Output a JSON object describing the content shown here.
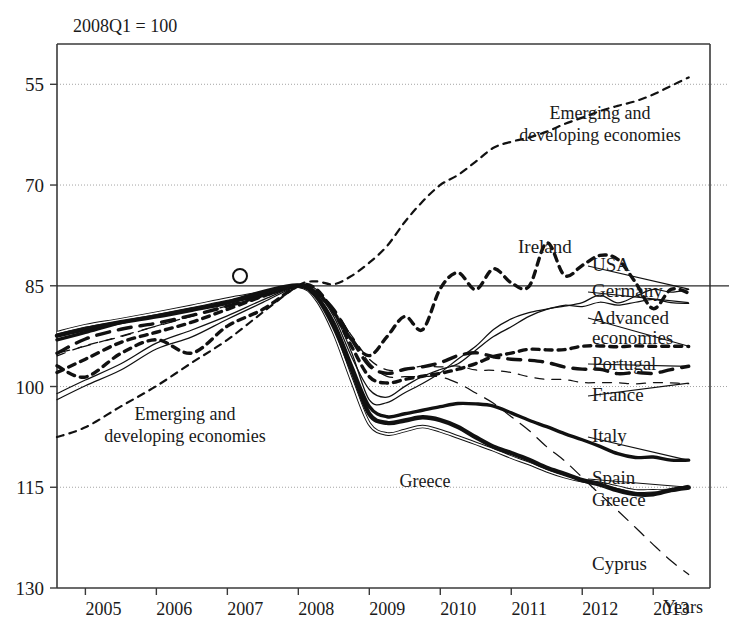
{
  "figure": {
    "note": "2008Q1 = 100",
    "xaxis_title": "Years",
    "yaxis_title": ""
  },
  "chart_data": {
    "type": "line",
    "title": "2008Q1 = 100",
    "subtitle": "",
    "xlabel": "Years",
    "ylabel": "",
    "xlim": [
      2004.6,
      2013.8
    ],
    "ylim": [
      55,
      136
    ],
    "yticks": [
      55,
      70,
      85,
      100,
      115,
      130
    ],
    "xticks": [
      2005,
      2006,
      2007,
      2008,
      2009,
      2010,
      2011,
      2012,
      2013
    ],
    "grid": true,
    "reference_line": 100,
    "legend_position": "right-inline-labels",
    "annotations": [
      {
        "text": "Emerging and developing economies",
        "x": 2006.2,
        "y": 80
      },
      {
        "text": "Emerging and developing economies",
        "x": 2012.0,
        "y": 124
      },
      {
        "text": "Greece",
        "x": 2010.9,
        "y": 72
      }
    ],
    "series": [
      {
        "name": "Emerging and developing economies",
        "style": "short-dashed thick",
        "x": [
          2004.6,
          2005.0,
          2005.5,
          2006.0,
          2006.5,
          2007.0,
          2007.5,
          2008.0,
          2008.25,
          2008.5,
          2008.75,
          2009.0,
          2009.25,
          2009.5,
          2009.75,
          2010.0,
          2010.25,
          2010.5,
          2010.75,
          2011.0,
          2011.25,
          2011.5,
          2011.75,
          2012.0,
          2012.25,
          2012.5,
          2012.75,
          2013.0,
          2013.25,
          2013.5
        ],
        "y": [
          77.5,
          79.0,
          82.0,
          85.0,
          88.5,
          92.0,
          96.0,
          100.0,
          100.7,
          100.2,
          101.5,
          103.5,
          106.0,
          109.5,
          112.5,
          115.0,
          116.5,
          118.5,
          120.5,
          121.5,
          122.0,
          123.0,
          124.0,
          125.0,
          126.0,
          126.8,
          127.5,
          128.5,
          129.8,
          131.0
        ]
      },
      {
        "name": "Ireland",
        "style": "short-dashed thick",
        "x": [
          2004.6,
          2005.0,
          2005.5,
          2006.0,
          2006.5,
          2007.0,
          2007.5,
          2008.0,
          2008.25,
          2008.5,
          2008.75,
          2009.0,
          2009.25,
          2009.5,
          2009.75,
          2010.0,
          2010.25,
          2010.5,
          2010.75,
          2011.0,
          2011.25,
          2011.5,
          2011.75,
          2012.0,
          2012.25,
          2012.5,
          2012.75,
          2013.0,
          2013.25,
          2013.5
        ],
        "y": [
          88.0,
          86.5,
          90.0,
          92.0,
          90.0,
          94.0,
          96.5,
          100.0,
          99.5,
          96.0,
          92.0,
          89.5,
          92.5,
          95.5,
          93.5,
          99.5,
          102.0,
          99.5,
          102.5,
          100.5,
          100.0,
          106.5,
          101.5,
          103.0,
          104.5,
          104.0,
          100.5,
          96.5,
          99.5,
          99.0
        ]
      },
      {
        "name": "USA",
        "style": "thin",
        "x": [
          2004.6,
          2005.0,
          2005.5,
          2006.0,
          2006.5,
          2007.0,
          2007.5,
          2008.0,
          2008.25,
          2008.5,
          2008.75,
          2009.0,
          2009.25,
          2009.5,
          2009.75,
          2010.0,
          2010.25,
          2010.5,
          2010.75,
          2011.0,
          2011.25,
          2011.5,
          2011.75,
          2012.0,
          2012.25,
          2012.5,
          2012.75,
          2013.0,
          2013.25,
          2013.5
        ],
        "y": [
          84.0,
          86.0,
          88.5,
          91.5,
          93.5,
          95.5,
          98.0,
          100.0,
          99.0,
          95.5,
          89.5,
          84.5,
          83.5,
          85.0,
          86.5,
          87.5,
          88.5,
          90.5,
          92.5,
          94.0,
          95.5,
          96.5,
          97.0,
          97.5,
          98.5,
          97.5,
          98.5,
          99.5,
          99.0,
          99.5
        ]
      },
      {
        "name": "Germany",
        "style": "thin",
        "x": [
          2004.6,
          2005.0,
          2005.5,
          2006.0,
          2006.5,
          2007.0,
          2007.5,
          2008.0,
          2008.25,
          2008.5,
          2008.75,
          2009.0,
          2009.25,
          2009.5,
          2009.75,
          2010.0,
          2010.25,
          2010.5,
          2010.75,
          2011.0,
          2011.25,
          2011.5,
          2011.75,
          2012.0,
          2012.25,
          2012.5,
          2012.75,
          2013.0,
          2013.25,
          2013.5
        ],
        "y": [
          83.0,
          85.0,
          87.5,
          90.5,
          92.5,
          95.0,
          97.5,
          100.0,
          99.5,
          96.0,
          90.0,
          83.0,
          82.5,
          84.0,
          85.5,
          87.0,
          89.0,
          91.0,
          93.5,
          95.0,
          96.0,
          96.5,
          97.0,
          97.0,
          97.5,
          97.0,
          97.5,
          98.0,
          97.5,
          97.5
        ]
      },
      {
        "name": "Advanced economies",
        "style": "short-dashed thick",
        "x": [
          2004.6,
          2005.0,
          2005.5,
          2006.0,
          2006.5,
          2007.0,
          2007.5,
          2008.0,
          2008.25,
          2008.5,
          2008.75,
          2009.0,
          2009.25,
          2009.5,
          2009.75,
          2010.0,
          2010.25,
          2010.5,
          2010.75,
          2011.0,
          2011.25,
          2011.5,
          2011.75,
          2012.0,
          2012.25,
          2012.5,
          2012.75,
          2013.0,
          2013.25,
          2013.5
        ],
        "y": [
          87.0,
          89.0,
          91.5,
          93.0,
          94.5,
          96.5,
          98.5,
          100.0,
          99.0,
          96.0,
          91.0,
          86.5,
          85.5,
          86.0,
          86.5,
          87.0,
          87.5,
          88.5,
          89.5,
          90.0,
          90.5,
          90.5,
          90.5,
          91.0,
          91.0,
          91.0,
          91.0,
          91.0,
          91.0,
          91.0
        ]
      },
      {
        "name": "Portugal",
        "style": "long-dashed thick",
        "x": [
          2004.6,
          2005.0,
          2005.5,
          2006.0,
          2006.5,
          2007.0,
          2007.5,
          2008.0,
          2008.25,
          2008.5,
          2008.75,
          2009.0,
          2009.25,
          2009.5,
          2009.75,
          2010.0,
          2010.25,
          2010.5,
          2010.75,
          2011.0,
          2011.25,
          2011.5,
          2011.75,
          2012.0,
          2012.25,
          2012.5,
          2012.75,
          2013.0,
          2013.25,
          2013.5
        ],
        "y": [
          90.0,
          92.0,
          93.5,
          94.5,
          95.5,
          97.0,
          98.5,
          100.0,
          99.0,
          96.5,
          92.0,
          88.0,
          87.0,
          87.5,
          88.0,
          88.5,
          89.5,
          90.0,
          89.5,
          89.0,
          89.0,
          88.5,
          88.0,
          87.5,
          87.5,
          87.0,
          87.0,
          87.0,
          87.5,
          88.0
        ]
      },
      {
        "name": "France",
        "style": "thin-gray",
        "x": [
          2004.6,
          2005.0,
          2005.5,
          2006.0,
          2006.5,
          2007.0,
          2007.5,
          2008.0,
          2008.25,
          2008.5,
          2008.75,
          2009.0,
          2009.25,
          2009.5,
          2009.75,
          2010.0,
          2010.25,
          2010.5,
          2010.75,
          2011.0,
          2011.25,
          2011.5,
          2011.75,
          2012.0,
          2012.25,
          2012.5,
          2012.75,
          2013.0,
          2013.25,
          2013.5
        ],
        "y": [
          89.5,
          91.0,
          92.5,
          94.0,
          95.5,
          97.0,
          98.5,
          100.0,
          99.0,
          96.5,
          92.5,
          89.0,
          87.5,
          87.5,
          88.0,
          88.0,
          88.0,
          87.5,
          87.5,
          87.0,
          86.5,
          86.0,
          86.0,
          85.5,
          85.5,
          85.5,
          85.5,
          85.5,
          85.5,
          85.5
        ]
      },
      {
        "name": "Italy",
        "style": "thick",
        "x": [
          2004.6,
          2005.0,
          2005.5,
          2006.0,
          2006.5,
          2007.0,
          2007.5,
          2008.0,
          2008.25,
          2008.5,
          2008.75,
          2009.0,
          2009.25,
          2009.5,
          2009.75,
          2010.0,
          2010.25,
          2010.5,
          2010.75,
          2011.0,
          2011.25,
          2011.5,
          2011.75,
          2012.0,
          2012.25,
          2012.5,
          2012.75,
          2013.0,
          2013.25,
          2013.5
        ],
        "y": [
          92.0,
          93.0,
          94.5,
          95.5,
          96.5,
          97.5,
          98.5,
          100.0,
          98.5,
          94.5,
          88.0,
          82.0,
          80.5,
          81.0,
          81.5,
          82.0,
          82.5,
          82.5,
          82.0,
          81.0,
          80.0,
          79.0,
          78.0,
          77.0,
          76.0,
          75.0,
          74.5,
          74.5,
          74.0,
          74.0
        ]
      },
      {
        "name": "Spain",
        "style": "double-line",
        "x": [
          2004.6,
          2005.0,
          2005.5,
          2006.0,
          2006.5,
          2007.0,
          2007.5,
          2008.0,
          2008.25,
          2008.5,
          2008.75,
          2009.0,
          2009.25,
          2009.5,
          2009.75,
          2010.0,
          2010.25,
          2010.5,
          2010.75,
          2011.0,
          2011.25,
          2011.5,
          2011.75,
          2012.0,
          2012.25,
          2012.5,
          2012.75,
          2013.0,
          2013.25,
          2013.5
        ],
        "y": [
          93.0,
          94.0,
          95.0,
          96.0,
          97.0,
          98.0,
          99.0,
          100.0,
          98.0,
          93.0,
          86.0,
          79.5,
          78.0,
          78.5,
          79.0,
          78.5,
          77.5,
          76.5,
          75.5,
          74.5,
          73.5,
          72.5,
          71.5,
          71.0,
          70.5,
          70.0,
          69.5,
          69.5,
          69.5,
          70.0
        ]
      },
      {
        "name": "Greece",
        "style": "xthick",
        "x": [
          2004.6,
          2005.0,
          2005.5,
          2006.0,
          2006.5,
          2007.0,
          2007.5,
          2008.0,
          2008.25,
          2008.5,
          2008.75,
          2009.0,
          2009.25,
          2009.5,
          2009.75,
          2010.0,
          2010.25,
          2010.5,
          2010.75,
          2011.0,
          2011.25,
          2011.5,
          2011.75,
          2012.0,
          2012.25,
          2012.5,
          2012.75,
          2013.0,
          2013.25,
          2013.5
        ],
        "y": [
          92.5,
          93.5,
          94.5,
          95.5,
          96.5,
          97.5,
          99.0,
          100.0,
          98.5,
          94.0,
          87.5,
          81.0,
          79.5,
          80.0,
          80.5,
          80.0,
          79.0,
          77.5,
          76.0,
          75.0,
          74.0,
          73.0,
          72.0,
          71.0,
          70.5,
          69.5,
          69.0,
          69.0,
          69.5,
          70.0
        ]
      },
      {
        "name": "Cyprus",
        "style": "long-dashed thin",
        "x": [
          2004.6,
          2005.0,
          2005.5,
          2006.0,
          2006.5,
          2007.0,
          2007.5,
          2008.0,
          2008.25,
          2008.5,
          2008.75,
          2009.0,
          2009.25,
          2009.5,
          2009.75,
          2010.0,
          2010.25,
          2010.5,
          2010.75,
          2011.0,
          2011.25,
          2011.5,
          2011.75,
          2012.0,
          2012.25,
          2012.5,
          2012.75,
          2013.0,
          2013.25,
          2013.5
        ],
        "y": [
          90.0,
          91.0,
          92.5,
          94.0,
          95.5,
          97.0,
          98.5,
          100.0,
          99.0,
          96.5,
          92.5,
          88.5,
          86.5,
          86.5,
          86.5,
          86.5,
          85.5,
          84.0,
          82.5,
          80.5,
          78.5,
          76.0,
          74.0,
          71.5,
          69.0,
          66.5,
          64.0,
          61.5,
          59.0,
          57.0
        ]
      }
    ]
  },
  "series_labels": [
    {
      "name": "Ireland",
      "text": "Ireland"
    },
    {
      "name": "USA",
      "text": "USA"
    },
    {
      "name": "Germany",
      "text": "Germany"
    },
    {
      "name": "Advanced economies",
      "text": "Advanced"
    },
    {
      "name": "Advanced economies2",
      "text": "economies"
    },
    {
      "name": "Portugal",
      "text": "Portugal"
    },
    {
      "name": "France",
      "text": "France"
    },
    {
      "name": "Italy",
      "text": "Italy"
    },
    {
      "name": "Spain",
      "text": "Spain"
    },
    {
      "name": "Greece",
      "text": "Greece"
    },
    {
      "name": "Cyprus",
      "text": "Cyprus"
    }
  ],
  "annotation_text": {
    "emerging_line1_left": "Emerging and",
    "emerging_line2_left": "developing economies",
    "emerging_line1_right": "Emerging and",
    "emerging_line2_right": "developing economies",
    "greece_inline": "Greece"
  },
  "ytick_labels": [
    "130",
    "115",
    "100",
    "85",
    "70",
    "55"
  ],
  "xtick_labels": [
    "2005",
    "2006",
    "2007",
    "2008",
    "2009",
    "2010",
    "2011",
    "2012",
    "2013"
  ]
}
